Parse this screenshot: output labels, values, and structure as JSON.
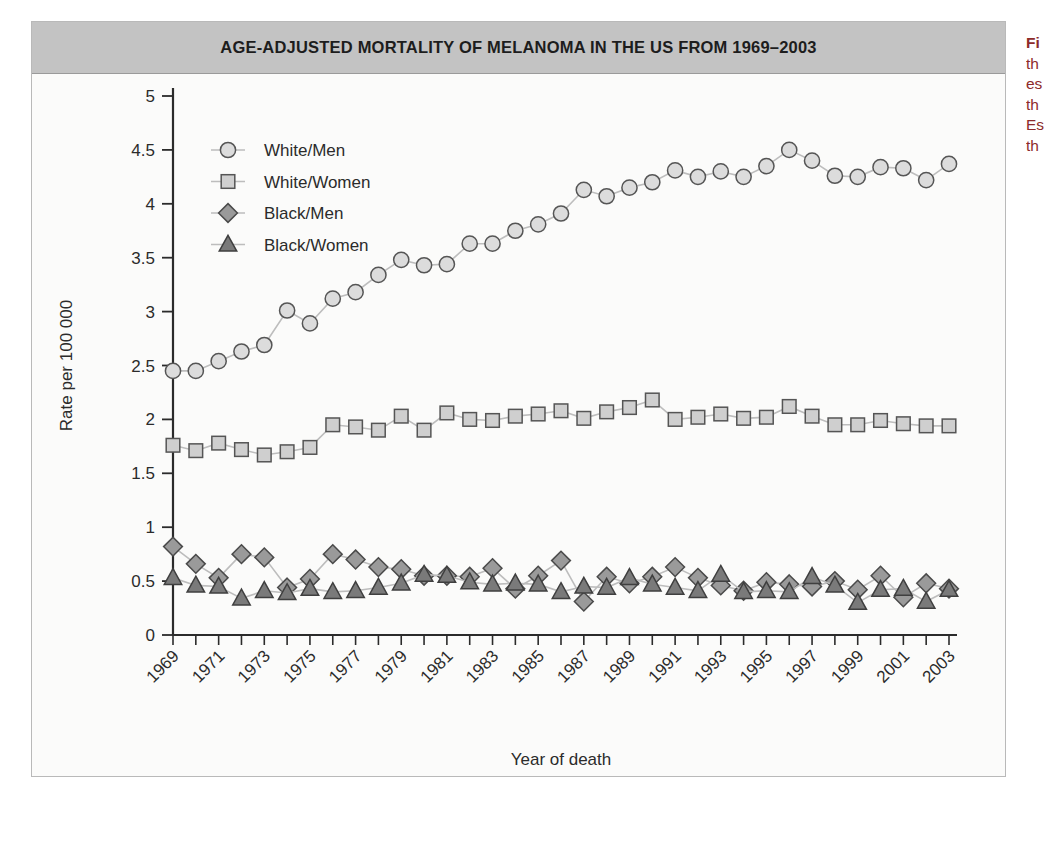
{
  "figure": {
    "title": "AGE-ADJUSTED MORTALITY OF MELANOMA IN THE US FROM 1969–2003",
    "panel_bg": "#fbfbfa",
    "title_band_bg": "#c3c3c3",
    "border_color": "#b9b9b9"
  },
  "caption": {
    "lines": [
      "Fi",
      "th",
      "es",
      "th",
      "Es",
      "th"
    ],
    "color": "#8d2b2b"
  },
  "axes": {
    "y_label": "Rate per 100 000",
    "x_label": "Year of death",
    "y_ticks": [
      "0",
      "0.5",
      "1",
      "1.5",
      "2",
      "2.5",
      "3",
      "3.5",
      "4",
      "4.5",
      "5"
    ],
    "x_ticks_labeled": [
      "1969",
      "1971",
      "1973",
      "1975",
      "1977",
      "1979",
      "1981",
      "1983",
      "1985",
      "1987",
      "1989",
      "1991",
      "1993",
      "1995",
      "1997",
      "1999",
      "2001",
      "2003"
    ]
  },
  "legend": {
    "position": "top-left-inside",
    "entries": [
      {
        "label": "White/Men",
        "marker": "circle",
        "fill": "#dcdcdc",
        "stroke": "#555555"
      },
      {
        "label": "White/Women",
        "marker": "square",
        "fill": "#cfcfcf",
        "stroke": "#555555"
      },
      {
        "label": "Black/Men",
        "marker": "diamond",
        "fill": "#9a9a9a",
        "stroke": "#4a4a4a"
      },
      {
        "label": "Black/Women",
        "marker": "triangle",
        "fill": "#7a7a7a",
        "stroke": "#3f3f3f"
      }
    ]
  },
  "chart_data": {
    "type": "line",
    "title": "AGE-ADJUSTED MORTALITY OF MELANOMA IN THE US FROM 1969–2003",
    "subtitle": "",
    "xlabel": "Year of death",
    "ylabel": "Rate per 100 000",
    "xlim": [
      1969,
      2003
    ],
    "ylim": [
      0,
      5
    ],
    "ytick_step": 0.5,
    "xtick_step": 1,
    "xtick_label_step": 2,
    "xtick_label_rotation": -45,
    "grid": false,
    "legend_position": "upper left",
    "x": [
      1969,
      1970,
      1971,
      1972,
      1973,
      1974,
      1975,
      1976,
      1977,
      1978,
      1979,
      1980,
      1981,
      1982,
      1983,
      1984,
      1985,
      1986,
      1987,
      1988,
      1989,
      1990,
      1991,
      1992,
      1993,
      1994,
      1995,
      1996,
      1997,
      1998,
      1999,
      2000,
      2001,
      2002,
      2003
    ],
    "series": [
      {
        "name": "White/Men",
        "marker": "circle",
        "values": [
          2.45,
          2.45,
          2.54,
          2.63,
          2.69,
          3.01,
          2.89,
          3.12,
          3.18,
          3.34,
          3.48,
          3.43,
          3.44,
          3.63,
          3.63,
          3.75,
          3.81,
          3.91,
          4.13,
          4.07,
          4.15,
          4.2,
          4.31,
          4.25,
          4.3,
          4.25,
          4.35,
          4.5,
          4.4,
          4.26,
          4.25,
          4.34,
          4.33,
          4.22,
          4.37
        ]
      },
      {
        "name": "White/Women",
        "marker": "square",
        "values": [
          1.76,
          1.71,
          1.78,
          1.72,
          1.67,
          1.7,
          1.74,
          1.95,
          1.93,
          1.9,
          2.03,
          1.9,
          2.06,
          2.0,
          1.99,
          2.03,
          2.05,
          2.08,
          2.01,
          2.07,
          2.11,
          2.18,
          2.0,
          2.02,
          2.05,
          2.01,
          2.02,
          2.12,
          2.03,
          1.95,
          1.95,
          1.99,
          1.96,
          1.94,
          1.94
        ]
      },
      {
        "name": "Black/Men",
        "marker": "diamond",
        "values": [
          0.82,
          0.66,
          0.53,
          0.75,
          0.72,
          0.44,
          0.52,
          0.75,
          0.7,
          0.63,
          0.61,
          0.55,
          0.55,
          0.54,
          0.62,
          0.43,
          0.55,
          0.69,
          0.31,
          0.54,
          0.48,
          0.54,
          0.63,
          0.53,
          0.46,
          0.41,
          0.49,
          0.47,
          0.45,
          0.5,
          0.42,
          0.55,
          0.35,
          0.48,
          0.43
        ]
      },
      {
        "name": "Black/Women",
        "marker": "triangle",
        "values": [
          0.53,
          0.46,
          0.45,
          0.34,
          0.41,
          0.39,
          0.43,
          0.4,
          0.41,
          0.44,
          0.48,
          0.56,
          0.55,
          0.49,
          0.47,
          0.48,
          0.47,
          0.4,
          0.45,
          0.44,
          0.53,
          0.47,
          0.44,
          0.41,
          0.56,
          0.4,
          0.41,
          0.4,
          0.54,
          0.46,
          0.3,
          0.42,
          0.43,
          0.31,
          0.42
        ]
      }
    ]
  }
}
